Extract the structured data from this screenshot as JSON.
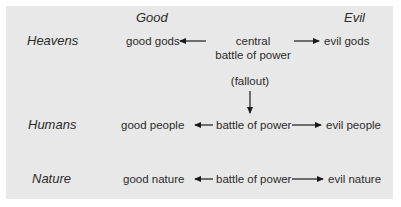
{
  "columns": {
    "good": "Good",
    "evil": "Evil"
  },
  "rows": [
    {
      "label": "Heavens",
      "good": "good gods",
      "center_line1": "central",
      "center_line2": "battle of power",
      "evil": "evil gods"
    },
    {
      "label": "Humans",
      "good": "good people",
      "center": "battle of power",
      "evil": "evil people"
    },
    {
      "label": "Nature",
      "good": "good nature",
      "center": "battle of power",
      "evil": "evil nature"
    }
  ],
  "fallout_label": "(fallout)",
  "colors": {
    "background": "#e8e8e8",
    "text": "#2b2b2b",
    "arrow": "#1a1a1a"
  }
}
